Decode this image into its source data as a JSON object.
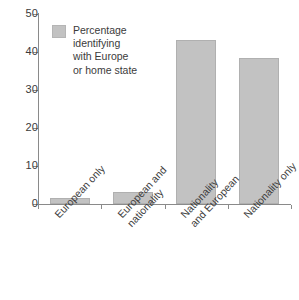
{
  "chart_data": {
    "type": "bar",
    "title": "",
    "subtitle": "",
    "xlabel": "",
    "ylabel": "",
    "categories": [
      "European only",
      "European and nationality",
      "Nationality and European",
      "Nationality only"
    ],
    "category_lines": [
      [
        "European only"
      ],
      [
        "European and",
        "nationality"
      ],
      [
        "Nationality",
        "and European"
      ],
      [
        "Nationality only"
      ]
    ],
    "values": [
      1.5,
      3.2,
      43.2,
      38.5
    ],
    "series": [
      {
        "name": "Percentage identifying with Europe or home state",
        "values": [
          1.5,
          3.2,
          43.2,
          38.5
        ]
      }
    ],
    "ylim": [
      0,
      50
    ],
    "yticks": [
      0,
      10,
      20,
      30,
      40,
      50
    ],
    "ytick_labels": [
      "0",
      "10",
      "20",
      "30",
      "40",
      "50"
    ],
    "grid": false,
    "legend_position": "inside-top-left",
    "annotations": [],
    "bar_color": "#c2c2c2",
    "bar_border_color": "#b0b0b0",
    "axis_color": "#8a8a8a",
    "text_color": "#3b3b3b"
  },
  "legend": {
    "label_lines": [
      "Percentage",
      "identifying",
      "with Europe",
      "or home state"
    ],
    "swatch_name": "bar-color-swatch"
  }
}
